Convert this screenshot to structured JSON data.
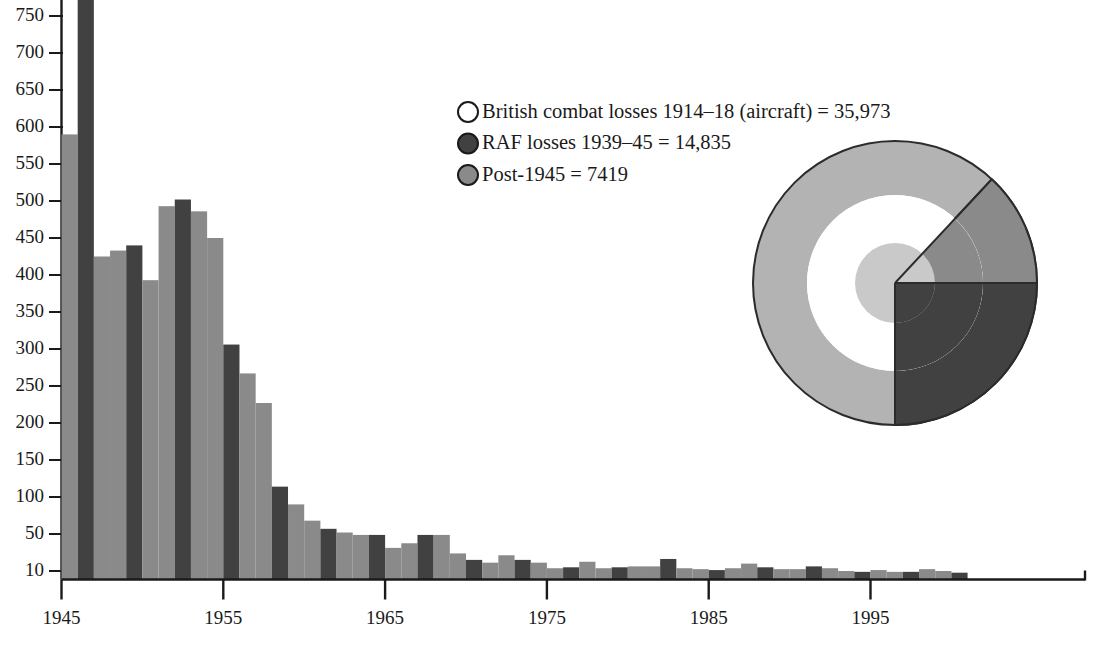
{
  "chart_data": {
    "type": "bar",
    "title": "",
    "subtitle": "",
    "xlabel": "",
    "ylabel": "",
    "grid": false,
    "axis": {
      "x_tick_labels": [
        "1945",
        "1955",
        "1965",
        "1975",
        "1985",
        "1995"
      ],
      "x_tick_values": [
        1945,
        1955,
        1965,
        1975,
        1985,
        1995
      ],
      "x_range": [
        1944.4,
        2002.5
      ],
      "y_tick_labels": [
        "10",
        "50",
        "100",
        "150",
        "200",
        "250",
        "300",
        "350",
        "400",
        "450",
        "500",
        "550",
        "600",
        "650",
        "700",
        "750"
      ],
      "y_tick_values": [
        10,
        50,
        100,
        150,
        200,
        250,
        300,
        350,
        400,
        450,
        500,
        550,
        600,
        650,
        700,
        750
      ],
      "y_axis_note": "broken axis: 10 then 50 then 50-unit steps",
      "ylim": [
        0,
        790
      ]
    },
    "bar_colors": {
      "dark": "#414141",
      "medium": "#8a8a8a",
      "light": "#b3b3b3"
    },
    "categories": [
      1945,
      1946,
      1947,
      1948,
      1949,
      1950,
      1951,
      1952,
      1953,
      1954,
      1955,
      1956,
      1957,
      1958,
      1959,
      1960,
      1961,
      1962,
      1963,
      1964,
      1965,
      1966,
      1967,
      1968,
      1969,
      1970,
      1971,
      1972,
      1973,
      1974,
      1975,
      1976,
      1977,
      1978,
      1979,
      1980,
      1981,
      1982,
      1983,
      1984,
      1985,
      1986,
      1987,
      1988,
      1989,
      1990,
      1991,
      1992,
      1993,
      1994,
      1995,
      1996,
      1997,
      1998,
      1999,
      2000
    ],
    "values": [
      590,
      1040,
      425,
      433,
      440,
      393,
      493,
      502,
      486,
      450,
      306,
      267,
      227,
      114,
      90,
      68,
      57,
      52,
      49,
      49,
      35,
      40,
      49,
      49,
      29,
      22,
      19,
      27,
      22,
      19,
      13,
      14,
      20,
      13,
      14,
      15,
      15,
      23,
      13,
      12,
      11,
      13,
      18,
      14,
      12,
      12,
      15,
      13,
      10,
      9,
      11,
      9,
      9,
      12,
      10,
      8
    ],
    "bar_shade_sequence": [
      "medium",
      "dark",
      "medium",
      "medium",
      "dark",
      "medium",
      "medium",
      "dark",
      "medium",
      "medium",
      "dark",
      "medium",
      "medium",
      "dark",
      "medium",
      "medium",
      "dark",
      "medium",
      "medium",
      "dark",
      "medium",
      "medium",
      "dark",
      "medium",
      "medium",
      "dark",
      "medium",
      "medium",
      "dark",
      "medium",
      "medium",
      "dark",
      "medium",
      "medium",
      "dark",
      "medium",
      "medium",
      "dark",
      "medium",
      "medium",
      "dark",
      "medium",
      "medium",
      "dark",
      "medium",
      "medium",
      "dark",
      "medium",
      "medium",
      "dark",
      "medium",
      "medium",
      "dark",
      "medium",
      "medium",
      "dark"
    ],
    "series": [
      {
        "name": "Annual aircraft losses",
        "values": [
          590,
          1040,
          425,
          433,
          440,
          393,
          493,
          502,
          486,
          450,
          306,
          267,
          227,
          114,
          90,
          68,
          57,
          52,
          49,
          49,
          35,
          40,
          49,
          49,
          29,
          22,
          19,
          27,
          22,
          19,
          13,
          14,
          20,
          13,
          14,
          15,
          15,
          23,
          13,
          12,
          11,
          13,
          18,
          14,
          12,
          12,
          15,
          13,
          10,
          9,
          11,
          9,
          9,
          12,
          10,
          8
        ]
      }
    ],
    "annotations": []
  },
  "legend": {
    "position": "upper-right",
    "items": [
      {
        "marker": "open-circle",
        "marker_fill": "#ffffff",
        "label": "British combat losses 1914–18 (aircraft) = 35,973",
        "value": 35973
      },
      {
        "marker": "dark-circle",
        "marker_fill": "#414141",
        "label": "RAF losses 1939–45 = 14,835",
        "value": 14835
      },
      {
        "marker": "gray-circle",
        "marker_fill": "#8a8a8a",
        "label": "Post-1945 = 7419",
        "value": 7419
      }
    ]
  },
  "pie_inset": {
    "type": "pie",
    "description": "nested proportional-area circles with angular wedges",
    "rings": [
      {
        "name": "British combat losses 1914-18",
        "radius_px": 142,
        "color": "#b3b3b3",
        "value": 35973
      },
      {
        "name": "RAF losses 1939-45",
        "radius_px": 88,
        "color": "#8a8a8a",
        "value": 14835
      },
      {
        "name": "Post-1945",
        "radius_px": 40,
        "color": "#c9c9c9",
        "value": 7419
      }
    ],
    "wedges": [
      {
        "name": "outer-light-wedge",
        "start_deg": 43,
        "end_deg": 360,
        "color": "#b3b3b3"
      },
      {
        "name": "mid-gray-wedge",
        "start_deg": 43,
        "end_deg": 90,
        "color": "#8a8a8a"
      },
      {
        "name": "dark-quarter-wedge",
        "start_deg": 90,
        "end_deg": 180,
        "color": "#414141"
      }
    ]
  }
}
